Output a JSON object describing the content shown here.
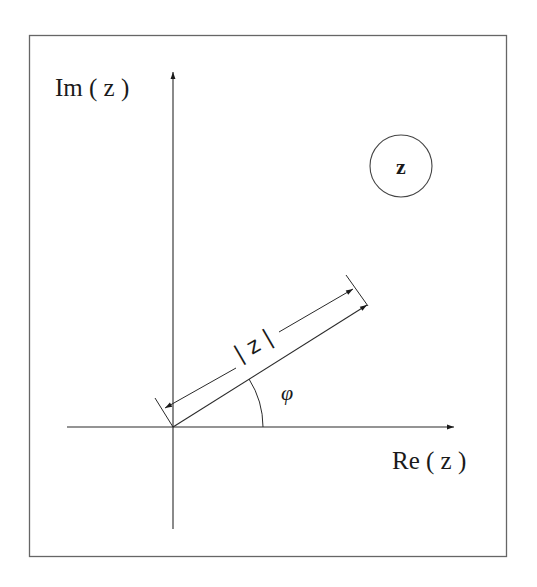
{
  "diagram": {
    "labels": {
      "imag_axis": "Im ( z )",
      "real_axis": "Re ( z )",
      "point": "z",
      "magnitude": "| z |",
      "angle": "φ"
    },
    "colors": {
      "line": "#2a2a2a",
      "frame": "#555555",
      "background": "#ffffff"
    },
    "geometry": {
      "origin": [
        173,
        427
      ],
      "vector_end": [
        367,
        305
      ],
      "angle_arc_radius": 90
    }
  }
}
